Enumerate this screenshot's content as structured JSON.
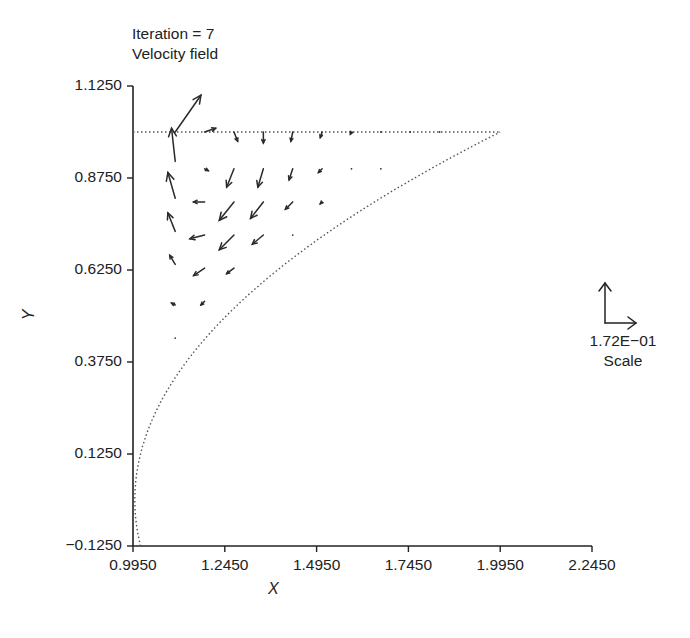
{
  "header": {
    "iteration_label": "Iteration = 7",
    "subtitle": "Velocity field"
  },
  "axes": {
    "xlabel": "X",
    "ylabel": "Y",
    "xticks": [
      "0.9950",
      "1.2450",
      "1.4950",
      "1.7450",
      "1.9950",
      "2.2450"
    ],
    "yticks": [
      "1.1250",
      "0.8750",
      "0.6250",
      "0.3750",
      "0.1250",
      "−0.1250"
    ]
  },
  "scale": {
    "value": "1.72E−01",
    "label": "Scale"
  },
  "colors": {
    "ink": "#222222",
    "dotted": "#555555",
    "background": "#ffffff"
  },
  "chart_data": {
    "type": "quiver",
    "xlabel": "X",
    "ylabel": "Y",
    "xlim": [
      0.995,
      2.245
    ],
    "ylim": [
      -0.125,
      1.125
    ],
    "xticks": [
      0.995,
      1.245,
      1.495,
      1.745,
      1.995,
      2.245
    ],
    "yticks": [
      -0.125,
      0.125,
      0.375,
      0.625,
      0.875,
      1.125
    ],
    "grid": false,
    "scale_reference": {
      "magnitude": 0.172,
      "label": "1.72E-01 Scale"
    },
    "boundaries": [
      {
        "name": "top-boundary",
        "style": "dotted",
        "points": [
          [
            0.995,
            1.0
          ],
          [
            1.995,
            1.0
          ]
        ]
      },
      {
        "name": "curved-boundary",
        "style": "dotted",
        "shape": "parabola-like x = 1 + y^2 from (1.0, -0.125) to (1.995, 1.0)"
      }
    ],
    "vectors": [
      {
        "x": 1.11,
        "y": 1.0,
        "u": 0.07,
        "v": 0.1
      },
      {
        "x": 1.11,
        "y": 0.92,
        "u": -0.01,
        "v": 0.09
      },
      {
        "x": 1.11,
        "y": 0.82,
        "u": -0.02,
        "v": 0.07
      },
      {
        "x": 1.11,
        "y": 0.73,
        "u": -0.02,
        "v": 0.05
      },
      {
        "x": 1.11,
        "y": 0.64,
        "u": -0.015,
        "v": 0.025
      },
      {
        "x": 1.11,
        "y": 0.53,
        "u": -0.01,
        "v": 0.005
      },
      {
        "x": 1.11,
        "y": 0.44,
        "u": 0.0,
        "v": 0.0
      },
      {
        "x": 1.19,
        "y": 1.0,
        "u": 0.03,
        "v": 0.01
      },
      {
        "x": 1.19,
        "y": 0.9,
        "u": 0.01,
        "v": -0.005
      },
      {
        "x": 1.19,
        "y": 0.81,
        "u": -0.03,
        "v": 0.0
      },
      {
        "x": 1.19,
        "y": 0.72,
        "u": -0.04,
        "v": -0.01
      },
      {
        "x": 1.19,
        "y": 0.63,
        "u": -0.03,
        "v": -0.02
      },
      {
        "x": 1.19,
        "y": 0.54,
        "u": -0.01,
        "v": -0.01
      },
      {
        "x": 1.27,
        "y": 1.0,
        "u": 0.01,
        "v": -0.025
      },
      {
        "x": 1.27,
        "y": 0.9,
        "u": -0.02,
        "v": -0.05
      },
      {
        "x": 1.27,
        "y": 0.81,
        "u": -0.04,
        "v": -0.05
      },
      {
        "x": 1.27,
        "y": 0.72,
        "u": -0.04,
        "v": -0.04
      },
      {
        "x": 1.27,
        "y": 0.63,
        "u": -0.02,
        "v": -0.015
      },
      {
        "x": 1.35,
        "y": 1.0,
        "u": 0.0,
        "v": -0.03
      },
      {
        "x": 1.35,
        "y": 0.9,
        "u": -0.015,
        "v": -0.05
      },
      {
        "x": 1.35,
        "y": 0.81,
        "u": -0.035,
        "v": -0.045
      },
      {
        "x": 1.35,
        "y": 0.72,
        "u": -0.03,
        "v": -0.025
      },
      {
        "x": 1.43,
        "y": 1.0,
        "u": -0.005,
        "v": -0.025
      },
      {
        "x": 1.43,
        "y": 0.9,
        "u": -0.01,
        "v": -0.03
      },
      {
        "x": 1.43,
        "y": 0.81,
        "u": -0.02,
        "v": -0.02
      },
      {
        "x": 1.43,
        "y": 0.72,
        "u": 0.0,
        "v": 0.0
      },
      {
        "x": 1.51,
        "y": 1.0,
        "u": -0.005,
        "v": -0.015
      },
      {
        "x": 1.51,
        "y": 0.9,
        "u": -0.01,
        "v": -0.01
      },
      {
        "x": 1.51,
        "y": 0.81,
        "u": -0.005,
        "v": -0.005
      },
      {
        "x": 1.59,
        "y": 1.0,
        "u": -0.003,
        "v": -0.006
      },
      {
        "x": 1.59,
        "y": 0.9,
        "u": -0.002,
        "v": -0.003
      },
      {
        "x": 1.67,
        "y": 1.0,
        "u": 0.0,
        "v": -0.003
      },
      {
        "x": 1.67,
        "y": 0.9,
        "u": 0.0,
        "v": 0.0
      },
      {
        "x": 1.75,
        "y": 1.0,
        "u": 0.0,
        "v": 0.0
      },
      {
        "x": 1.83,
        "y": 1.0,
        "u": 0.0,
        "v": 0.0
      }
    ]
  }
}
